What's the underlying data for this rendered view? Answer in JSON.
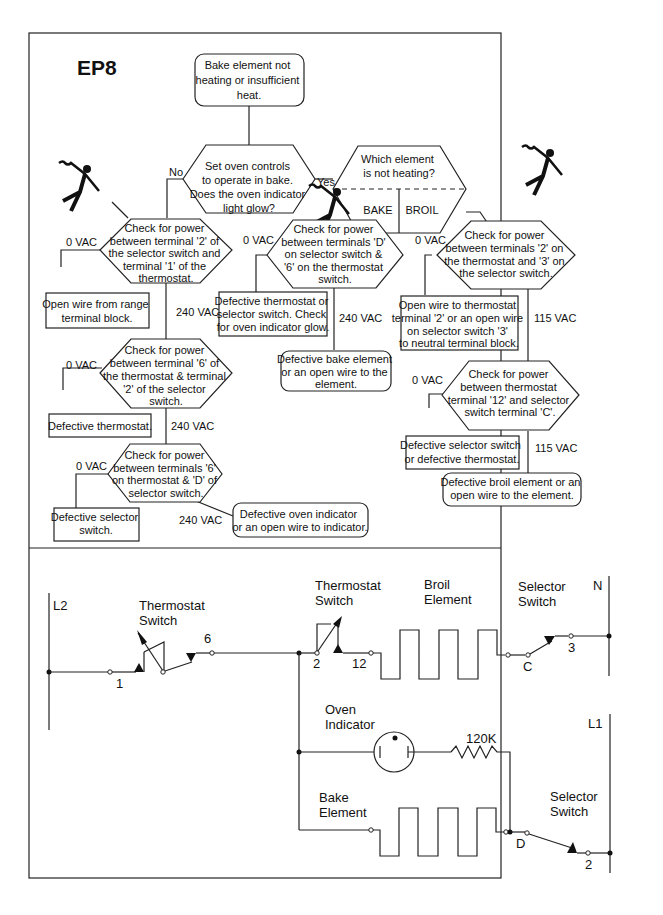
{
  "title": "EP8",
  "flowchart": {
    "start": [
      "Bake element not",
      "heating or insufficient",
      "heat."
    ],
    "q1": [
      "Set oven controls",
      "to operate in bake.",
      "Does the oven indicator",
      "light glow?"
    ],
    "q1_no": "No",
    "q1_yes": "Yes",
    "q_which": [
      "Which element",
      "is not heating?"
    ],
    "q_which_bake": "BAKE",
    "q_which_broil": "BROIL",
    "left_check1": [
      "Check for power",
      "between terminal '2' of",
      "the selector switch and",
      "terminal '1' of the",
      "thermostat."
    ],
    "left_check1_0": "0 VAC",
    "left_check1_240": "240 VAC",
    "left_result1": [
      "Open wire from range",
      "terminal block."
    ],
    "left_check2": [
      "Check for power",
      "between terminal '6' of",
      "the thermostat & terminal",
      "'2' of the selector",
      "switch."
    ],
    "left_check2_0": "0 VAC",
    "left_check2_240": "240 VAC",
    "left_result2": [
      "Defective thermostat."
    ],
    "left_check3": [
      "Check for power",
      "between terminals '6'",
      "on thermostat & 'D' of",
      "selector switch."
    ],
    "left_check3_0": "0 VAC",
    "left_check3_240": "240 VAC",
    "left_result3": [
      "Defective selector",
      "switch."
    ],
    "left_result3b": [
      "Defective oven indicator",
      "or an open wire to indicator."
    ],
    "mid_check": [
      "Check for power",
      "between terminals 'D'",
      "on selector switch &",
      "'6' on the thermostat",
      "switch."
    ],
    "mid_check_0": "0 VAC",
    "mid_check_240": "240 VAC",
    "mid_result_0": [
      "Defective thermostat or",
      "selector switch.  Check",
      "for oven indicator glow."
    ],
    "mid_result_240": [
      "Defective bake element",
      "or an open wire to the",
      "element."
    ],
    "right_check1": [
      "Check for power",
      "between terminals '2' on",
      "the thermostat and '3' on",
      "the selector switch."
    ],
    "right_check1_0": "0 VAC",
    "right_check1_115": "115 VAC",
    "right_result1": [
      "Open wire to thermostat",
      "terminal '2' or an open wire",
      "on selector switch '3'",
      "to neutral terminal block."
    ],
    "right_check2": [
      "Check for power",
      "between thermostat",
      "terminal '12' and selector",
      "switch terminal 'C'."
    ],
    "right_check2_0": "0 VAC",
    "right_check2_115": "115 VAC",
    "right_result2": [
      "Defective selector switch",
      "or defective thermostat."
    ],
    "right_result3": [
      "Defective broil element or an",
      "open wire to the element."
    ]
  },
  "schematic": {
    "l2": "L2",
    "n": "N",
    "l1": "L1",
    "thermostat_switch_1": [
      "Thermostat",
      "Switch"
    ],
    "thermostat_switch_2": [
      "Thermostat",
      "Switch"
    ],
    "broil_element": [
      "Broil",
      "Element"
    ],
    "selector_switch_1": [
      "Selector",
      "Switch"
    ],
    "selector_switch_2": [
      "Selector",
      "Switch"
    ],
    "oven_indicator": [
      "Oven",
      "Indicator"
    ],
    "bake_element": [
      "Bake",
      "Element"
    ],
    "resistor": "120K",
    "terminals": {
      "t1": "1",
      "t6": "6",
      "t2a": "2",
      "t12": "12",
      "tC": "C",
      "t3": "3",
      "tD": "D",
      "t2b": "2"
    }
  }
}
